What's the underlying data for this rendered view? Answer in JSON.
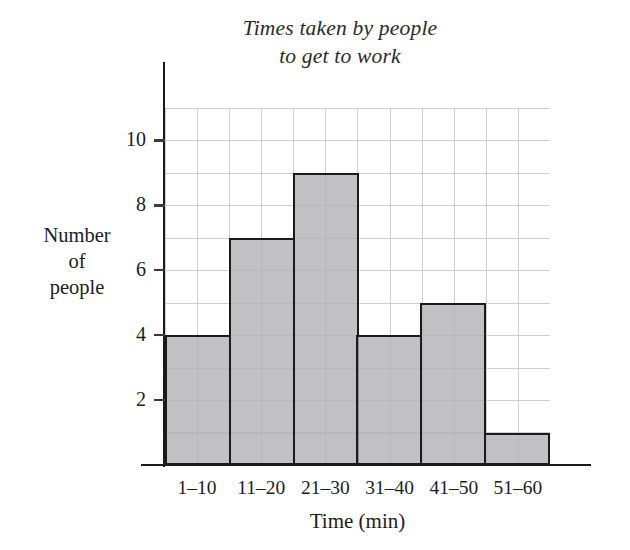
{
  "chart_data": {
    "type": "bar",
    "title": "Times taken by people to get to work",
    "title_lines": [
      "Times taken by people",
      "to get to work"
    ],
    "categories": [
      "1–10",
      "11–20",
      "21–30",
      "31–40",
      "41–50",
      "51–60"
    ],
    "values": [
      4,
      7,
      9,
      4,
      5,
      1
    ],
    "xlabel": "Time (min)",
    "ylabel": "Number of people",
    "ylabel_lines": [
      "Number",
      "of",
      "people"
    ],
    "ylim": [
      0,
      11
    ],
    "ytick_values": [
      10,
      8,
      6,
      4,
      2
    ],
    "ytick_labels": [
      "10",
      "8",
      "6",
      "4",
      "2"
    ],
    "grid": true,
    "grid_step": 1,
    "legend": null,
    "bar_fill_color": "#b0b0b2",
    "bar_edge_color": "#1b1b1d",
    "grid_color": "#cfcfd2",
    "axis_color": "#1b1b1d",
    "text_color": "#1d1d20"
  }
}
